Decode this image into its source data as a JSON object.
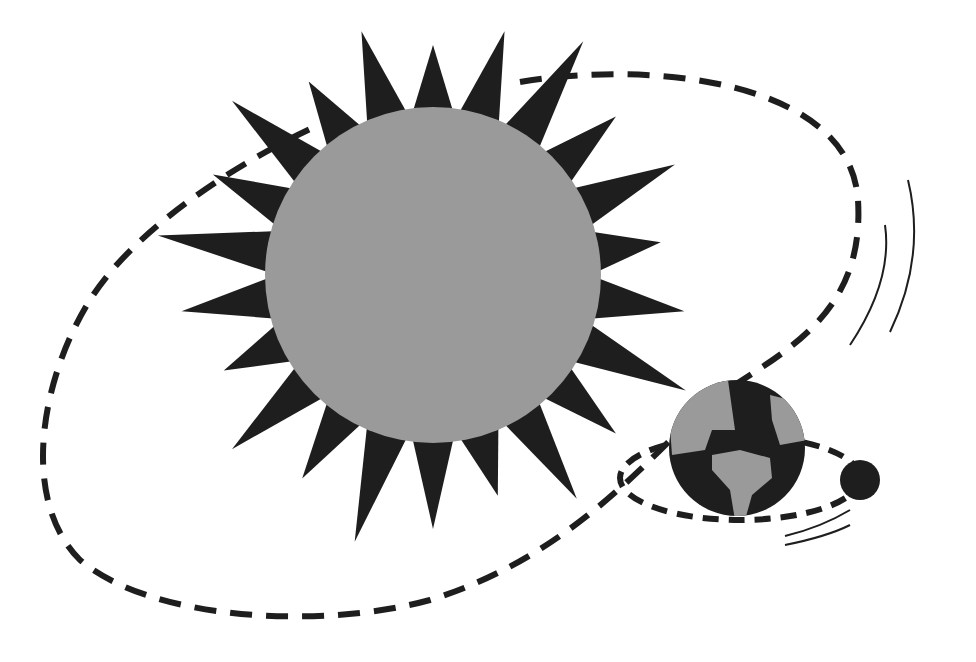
{
  "diagram": {
    "elements": [
      {
        "name": "sun",
        "shape": "spiky circle"
      },
      {
        "name": "earth",
        "shape": "globe with continents"
      },
      {
        "name": "moon",
        "shape": "small dark circle"
      },
      {
        "name": "earth-orbit",
        "style": "dashed ellipse"
      },
      {
        "name": "moon-orbit",
        "style": "dashed ellipse"
      },
      {
        "name": "motion-lines",
        "count": 4
      }
    ],
    "colors": {
      "sun_disc": "#9a9a9a",
      "rays": "#1e1e1e",
      "earth_land": "#9a9a9a",
      "earth_sea": "#1e1e1e",
      "moon": "#1e1e1e",
      "background": "#ffffff"
    }
  }
}
